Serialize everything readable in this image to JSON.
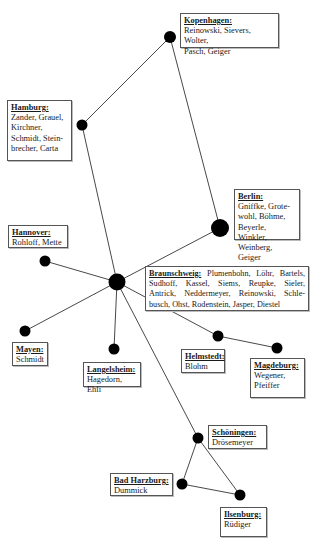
{
  "diagram": {
    "type": "network",
    "line_color": "#333333",
    "node_color": "#000000",
    "hub": "braunschweig",
    "nodes": [
      {
        "id": "kopenhagen",
        "title": "Kopenhagen:",
        "members": "Reinowski, Sievers, Wolter, Pasch, Geiger"
      },
      {
        "id": "hamburg",
        "title": "Hamburg:",
        "members": "Zander, Grauel, Kirchner, Schmidt, Stein-brecher, Carta"
      },
      {
        "id": "berlin",
        "title": "Berlin:",
        "members": "Gniffke, Grote-wohl, Böhme, Beyerle, Winkler, Weinberg, Geiger"
      },
      {
        "id": "hannover",
        "title": "Hannover:",
        "members": "Rohloff, Mette"
      },
      {
        "id": "braunschweig",
        "title": "Braunschweig:",
        "members": "Plumenbohn, Löhr, Bartels, Sudhoff, Kassel, Siems, Reupke, Sieler, Antrick, Neddermeyer, Reinowski, Schle-busch, Ohst, Rodenstein, Jasper, Diestel"
      },
      {
        "id": "mayen",
        "title": "Mayen:",
        "members": "Schmidt"
      },
      {
        "id": "langelsheim",
        "title": "Langelsheim:",
        "members": "Hagedorn, Ehli"
      },
      {
        "id": "helmstedt",
        "title": "Helmstedt:",
        "members": "Blohm"
      },
      {
        "id": "magdeburg",
        "title": "Magdeburg:",
        "members": "Wegener, Pfeiffer"
      },
      {
        "id": "schoeningen",
        "title": "Schöningen:",
        "members": "Drösemeyer"
      },
      {
        "id": "bad_harzburg",
        "title": "Bad Harzburg:",
        "members": "Dummick"
      },
      {
        "id": "ilsenburg",
        "title": "Ilsenburg:",
        "members": "Rüdiger"
      }
    ],
    "edges": [
      [
        "kopenhagen",
        "hamburg"
      ],
      [
        "kopenhagen",
        "berlin"
      ],
      [
        "hamburg",
        "braunschweig"
      ],
      [
        "berlin",
        "braunschweig"
      ],
      [
        "hannover",
        "braunschweig"
      ],
      [
        "mayen",
        "braunschweig"
      ],
      [
        "langelsheim",
        "braunschweig"
      ],
      [
        "helmstedt",
        "braunschweig"
      ],
      [
        "helmstedt",
        "magdeburg"
      ],
      [
        "schoeningen",
        "braunschweig"
      ],
      [
        "schoeningen",
        "bad_harzburg"
      ],
      [
        "schoeningen",
        "ilsenburg"
      ],
      [
        "bad_harzburg",
        "ilsenburg"
      ]
    ]
  },
  "labels": {
    "kopenhagen": {
      "title": "Kopenhagen:",
      "lines": [
        "Reinowski, Sievers, Wolter,",
        "Pasch, Geiger"
      ]
    },
    "hamburg": {
      "title": "Hamburg:",
      "lines": [
        "Zander, Grauel,",
        "Kirchner,",
        "Schmidt, Stein-",
        "brecher, Carta"
      ]
    },
    "berlin": {
      "title": "Berlin:",
      "lines": [
        "Gniffke, Grote-",
        "wohl, Böhme,",
        "Beyerle, Winkler,",
        "Weinberg, Geiger"
      ]
    },
    "hannover": {
      "title": "Hannover:",
      "lines": [
        "Rohloff, Mette"
      ]
    },
    "braunschweig": {
      "title": "Braunschweig:",
      "first": "Plumenbohn, Löhr, Bartels,",
      "lines": [
        "Sudhoff, Kassel, Siems, Reupke, Sieler,",
        "Antrick, Neddermeyer, Reinowski, Schle-",
        "busch, Ohst, Rodenstein, Jasper, Diestel"
      ]
    },
    "mayen": {
      "title": "Mayen:",
      "lines": [
        "Schmidt"
      ]
    },
    "langelsheim": {
      "title": "Langelsheim:",
      "lines": [
        "Hagedorn, Ehli"
      ]
    },
    "helmstedt": {
      "title": "Helmstedt:",
      "lines": [
        "Blohm"
      ]
    },
    "magdeburg": {
      "title": "Magdeburg:",
      "lines": [
        "Wegener,",
        "Pfeiffer"
      ]
    },
    "schoeningen": {
      "title": "Schöningen:",
      "lines": [
        "Drösemeyer"
      ]
    },
    "bad_harzburg": {
      "title": "Bad Harzburg:",
      "lines": [
        "Dummick"
      ]
    },
    "ilsenburg": {
      "title": "Ilsenburg:",
      "lines": [
        "Rüdiger"
      ]
    }
  }
}
